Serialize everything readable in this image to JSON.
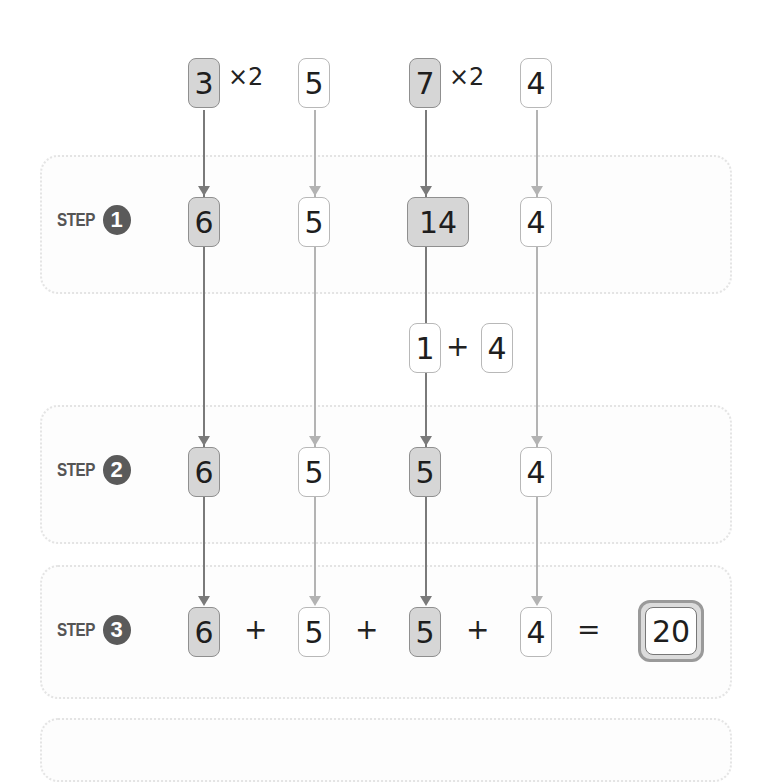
{
  "top_row": {
    "a": "3",
    "a_mult": "×2",
    "b": "5",
    "c": "7",
    "c_mult": "×2",
    "d": "4"
  },
  "steps": [
    {
      "label": "STEP",
      "number": "1",
      "values": [
        "6",
        "5",
        "14",
        "4"
      ]
    },
    {
      "label": "STEP",
      "number": "2",
      "values": [
        "6",
        "5",
        "5",
        "4"
      ]
    },
    {
      "label": "STEP",
      "number": "3",
      "values": [
        "6",
        "5",
        "5",
        "4"
      ],
      "operators": [
        "+",
        "+",
        "+",
        "="
      ],
      "result": "20"
    }
  ],
  "digit_split": {
    "left": "1",
    "operator": "+",
    "right": "4"
  },
  "colors": {
    "shaded_box": "#d6d6d6",
    "plain_box": "#ffffff",
    "dark_arrow": "#7a7a7a",
    "light_arrow": "#b3b3b3",
    "step_badge": "#5a5a5a"
  }
}
